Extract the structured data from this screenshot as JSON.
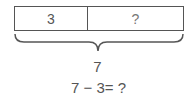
{
  "bar_model": {
    "parts": [
      {
        "label": "3"
      },
      {
        "label": "?"
      }
    ],
    "total": "7"
  },
  "equation": "7 − 3= ?"
}
